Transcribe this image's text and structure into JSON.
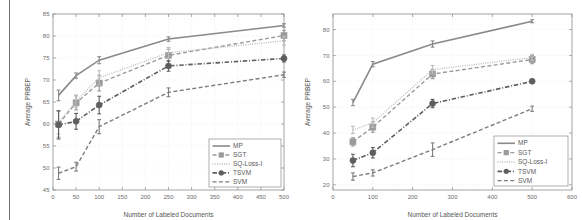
{
  "figure": {
    "background": "#ffffff",
    "left_rule_color": "#6f6f6f",
    "axis_color": "#8c8c8c",
    "grid_color": "#e3e3e3",
    "text_color": "#6b6b6b"
  },
  "series_style": {
    "MP": {
      "color": "#8a8a8a",
      "dash": "none",
      "marker": "none",
      "width": 1.6
    },
    "SGT": {
      "color": "#9a9a9a",
      "dash": "dashed",
      "marker": "square",
      "width": 1.4
    },
    "SQ-Loss-I": {
      "color": "#bdbdbd",
      "dash": "dotted",
      "marker": "none",
      "width": 1.4
    },
    "TSVM": {
      "color": "#5e5e5e",
      "dash": "dashdot",
      "marker": "circle",
      "width": 1.6
    },
    "SVM": {
      "color": "#7d7d7d",
      "dash": "dashed",
      "marker": "none",
      "width": 1.4
    }
  },
  "chart_data": [
    {
      "type": "line",
      "id": "left-chart",
      "title": "",
      "xlabel": "Number of Labeled Documents",
      "ylabel": "Average PRBEP",
      "xlim": [
        0,
        500
      ],
      "ylim": [
        45,
        85
      ],
      "xticks": [
        0,
        50,
        100,
        150,
        200,
        250,
        300,
        350,
        400,
        450,
        500
      ],
      "yticks": [
        45,
        50,
        55,
        60,
        65,
        70,
        75,
        80,
        85
      ],
      "grid": true,
      "legend_position": "bottom-right",
      "x": [
        12,
        50,
        100,
        250,
        500
      ],
      "series": [
        {
          "name": "MP",
          "values": [
            66.5,
            71.0,
            74.5,
            79.3,
            82.4
          ],
          "errors": [
            1.2,
            0.6,
            0.8,
            0.5,
            0.4
          ]
        },
        {
          "name": "SGT",
          "values": [
            60.0,
            64.8,
            69.3,
            75.6,
            80.1
          ],
          "errors": [
            3.0,
            1.6,
            1.8,
            1.4,
            1.2
          ]
        },
        {
          "name": "SQ-Loss-I",
          "values": [
            60.3,
            65.2,
            70.5,
            76.2,
            78.9
          ],
          "errors": [
            2.6,
            1.4,
            1.6,
            1.2,
            1.0
          ]
        },
        {
          "name": "TSVM",
          "values": [
            59.8,
            60.6,
            64.3,
            73.2,
            74.9
          ],
          "errors": [
            3.2,
            1.8,
            2.0,
            1.2,
            0.8
          ]
        },
        {
          "name": "SVM",
          "values": [
            48.8,
            50.3,
            59.4,
            67.2,
            71.2
          ],
          "errors": [
            1.4,
            1.0,
            1.6,
            1.0,
            0.6
          ]
        }
      ]
    },
    {
      "type": "line",
      "id": "right-chart",
      "title": "",
      "xlabel": "Number of Labeled Documents",
      "ylabel": "Average PRBEP",
      "xlim": [
        0,
        600
      ],
      "ylim": [
        18,
        86
      ],
      "xticks": [
        0,
        100,
        200,
        300,
        400,
        500,
        600
      ],
      "yticks": [
        20,
        30,
        40,
        50,
        60,
        70,
        80
      ],
      "grid": true,
      "legend_position": "bottom-right",
      "x": [
        50,
        100,
        250,
        500
      ],
      "series": [
        {
          "name": "MP",
          "values": [
            51.8,
            66.6,
            74.4,
            83.2
          ],
          "errors": [
            1.2,
            1.0,
            1.2,
            0.6
          ]
        },
        {
          "name": "SGT",
          "values": [
            36.6,
            42.3,
            62.8,
            68.4
          ],
          "errors": [
            1.6,
            2.0,
            1.8,
            1.6
          ]
        },
        {
          "name": "SQ-Loss-I",
          "values": [
            41.2,
            44.0,
            64.5,
            69.2
          ],
          "errors": [
            1.4,
            1.8,
            1.6,
            1.2
          ]
        },
        {
          "name": "TSVM",
          "values": [
            29.4,
            32.4,
            51.4,
            60.0
          ],
          "errors": [
            2.4,
            2.0,
            1.6,
            0.8
          ]
        },
        {
          "name": "SVM",
          "values": [
            23.2,
            24.6,
            33.6,
            49.4
          ],
          "errors": [
            1.4,
            1.2,
            2.6,
            1.0
          ]
        }
      ]
    }
  ],
  "legend": {
    "entries": [
      "MP",
      "SGT",
      "SQ-Loss-I",
      "TSVM",
      "SVM"
    ]
  }
}
